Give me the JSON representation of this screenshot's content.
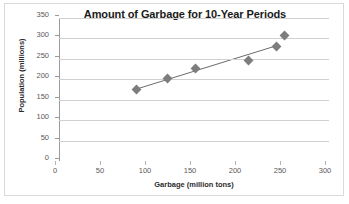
{
  "chart_data": {
    "type": "scatter",
    "title": "Amount of Garbage for 10-Year Periods",
    "xlabel": "Garbage (million tons)",
    "ylabel": "Population (millions)",
    "xlim": [
      0,
      300
    ],
    "ylim": [
      0,
      350
    ],
    "xticks": [
      0,
      50,
      100,
      150,
      200,
      250,
      300
    ],
    "yticks": [
      0,
      50,
      100,
      150,
      200,
      250,
      300,
      350
    ],
    "grid": "horizontal",
    "legend": "none",
    "marker_color": "#7d7d7d",
    "marker_shape": "diamond",
    "trendline": {
      "visible": true,
      "color": "#6b6b6b",
      "x_start": 86,
      "y_start": 176,
      "x_end": 243,
      "y_end": 283
    },
    "points": [
      {
        "x": 86,
        "y": 176
      },
      {
        "x": 121,
        "y": 202
      },
      {
        "x": 152,
        "y": 226
      },
      {
        "x": 210,
        "y": 245
      },
      {
        "x": 242,
        "y": 281
      },
      {
        "x": 251,
        "y": 308
      }
    ]
  }
}
